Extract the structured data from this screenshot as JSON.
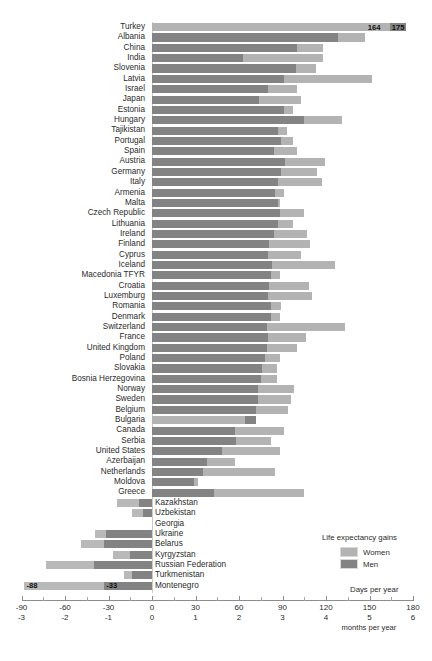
{
  "legend": {
    "title": "Life expectancy gains",
    "women_label": "Women",
    "men_label": "Men",
    "women_color": "#b3b3b3",
    "men_color": "#838383"
  },
  "axis": {
    "days_label": "Days per year",
    "months_label": "months per year",
    "days_ticks": [
      "-90",
      "-60",
      "-30",
      "0",
      "30",
      "60",
      "90",
      "120",
      "150",
      "180"
    ],
    "months_ticks": [
      "-3",
      "-2",
      "-1",
      "0",
      "1",
      "2",
      "3",
      "4",
      "5",
      "6"
    ]
  },
  "value_labels": {
    "turkey_women": "164",
    "turkey_men": "175",
    "montenegro_women": "-88",
    "montenegro_men": "-33"
  },
  "chart_data": {
    "type": "bar",
    "title": "",
    "xlabel": "Days per year",
    "ylabel": "",
    "xlim": [
      -90,
      180
    ],
    "grid": false,
    "legend_position": "bottom-right",
    "orientation": "horizontal",
    "secondary_xaxis": {
      "label": "months per year",
      "ticks": [
        -3,
        -2,
        -1,
        0,
        1,
        2,
        3,
        4,
        5,
        6
      ]
    },
    "categories": [
      "Turkey",
      "Albania",
      "China",
      "India",
      "Slovenia",
      "Latvia",
      "Israel",
      "Japan",
      "Estonia",
      "Hungary",
      "Tajikistan",
      "Portugal",
      "Spain",
      "Austria",
      "Germany",
      "Italy",
      "Armenia",
      "Malta",
      "Czech Republic",
      "Lithuania",
      "Ireland",
      "Finland",
      "Cyprus",
      "Iceland",
      "Macedonia TFYR",
      "Croatia",
      "Luxemburg",
      "Romania",
      "Denmark",
      "Switzerland",
      "France",
      "United Kingdom",
      "Poland",
      "Slovakia",
      "Bosnia Herzegovina",
      "Norway",
      "Sweden",
      "Belgium",
      "Bulgaria",
      "Canada",
      "Serbia",
      "United States",
      "Azerbaijan",
      "Netherlands",
      "Moldova",
      "Greece",
      "Kazakhstan",
      "Uzbekistan",
      "Georgia",
      "Ukraine",
      "Belarus",
      "Kyrgyzstan",
      "Russian Federation",
      "Turkmenistan",
      "Montenegro"
    ],
    "series": [
      {
        "name": "Women",
        "color": "#b3b3b3",
        "values": [
          164,
          147,
          118,
          118,
          113,
          152,
          100,
          103,
          97,
          131,
          93,
          97,
          100,
          119,
          114,
          117,
          91,
          88,
          105,
          97,
          107,
          109,
          103,
          126,
          88,
          108,
          110,
          89,
          88,
          133,
          106,
          100,
          88,
          86,
          86,
          98,
          96,
          94,
          64,
          91,
          82,
          88,
          57,
          85,
          32,
          105,
          -24,
          -14,
          0,
          -39,
          -49,
          -27,
          -73,
          -19,
          -88
        ]
      },
      {
        "name": "Men",
        "color": "#838383",
        "values": [
          175,
          128,
          100,
          63,
          99,
          91,
          80,
          74,
          91,
          105,
          87,
          89,
          84,
          92,
          89,
          87,
          85,
          87,
          88,
          87,
          84,
          81,
          80,
          83,
          82,
          81,
          80,
          82,
          82,
          79,
          80,
          79,
          78,
          76,
          75,
          73,
          73,
          72,
          72,
          57,
          58,
          48,
          38,
          35,
          29,
          43,
          -9,
          -6,
          0,
          -32,
          -33,
          -15,
          -40,
          -14,
          -33
        ]
      }
    ],
    "note": "Paired horizontal bars per country; bars are overlaid sharing a common baseline at 0."
  },
  "rows": [
    {
      "name": "Turkey",
      "w": 164,
      "m": 175,
      "side": "left"
    },
    {
      "name": "Albania",
      "w": 147,
      "m": 128,
      "side": "left"
    },
    {
      "name": "China",
      "w": 118,
      "m": 100,
      "side": "left"
    },
    {
      "name": "India",
      "w": 118,
      "m": 63,
      "side": "left"
    },
    {
      "name": "Slovenia",
      "w": 113,
      "m": 99,
      "side": "left"
    },
    {
      "name": "Latvia",
      "w": 152,
      "m": 91,
      "side": "left"
    },
    {
      "name": "Israel",
      "w": 100,
      "m": 80,
      "side": "left"
    },
    {
      "name": "Japan",
      "w": 103,
      "m": 74,
      "side": "left"
    },
    {
      "name": "Estonia",
      "w": 97,
      "m": 91,
      "side": "left"
    },
    {
      "name": "Hungary",
      "w": 131,
      "m": 105,
      "side": "left"
    },
    {
      "name": "Tajikistan",
      "w": 93,
      "m": 87,
      "side": "left"
    },
    {
      "name": "Portugal",
      "w": 97,
      "m": 89,
      "side": "left"
    },
    {
      "name": "Spain",
      "w": 100,
      "m": 84,
      "side": "left"
    },
    {
      "name": "Austria",
      "w": 119,
      "m": 92,
      "side": "left"
    },
    {
      "name": "Germany",
      "w": 114,
      "m": 89,
      "side": "left"
    },
    {
      "name": "Italy",
      "w": 117,
      "m": 87,
      "side": "left"
    },
    {
      "name": "Armenia",
      "w": 91,
      "m": 85,
      "side": "left"
    },
    {
      "name": "Malta",
      "w": 88,
      "m": 87,
      "side": "left"
    },
    {
      "name": "Czech Republic",
      "w": 105,
      "m": 88,
      "side": "left"
    },
    {
      "name": "Lithuania",
      "w": 97,
      "m": 87,
      "side": "left"
    },
    {
      "name": "Ireland",
      "w": 107,
      "m": 84,
      "side": "left"
    },
    {
      "name": "Finland",
      "w": 109,
      "m": 81,
      "side": "left"
    },
    {
      "name": "Cyprus",
      "w": 103,
      "m": 80,
      "side": "left"
    },
    {
      "name": "Iceland",
      "w": 126,
      "m": 83,
      "side": "left"
    },
    {
      "name": "Macedonia TFYR",
      "w": 88,
      "m": 82,
      "side": "left"
    },
    {
      "name": "Croatia",
      "w": 108,
      "m": 81,
      "side": "left"
    },
    {
      "name": "Luxemburg",
      "w": 110,
      "m": 80,
      "side": "left"
    },
    {
      "name": "Romania",
      "w": 89,
      "m": 82,
      "side": "left"
    },
    {
      "name": "Denmark",
      "w": 88,
      "m": 82,
      "side": "left"
    },
    {
      "name": "Switzerland",
      "w": 133,
      "m": 79,
      "side": "left"
    },
    {
      "name": "France",
      "w": 106,
      "m": 80,
      "side": "left"
    },
    {
      "name": "United Kingdom",
      "w": 100,
      "m": 79,
      "side": "left"
    },
    {
      "name": "Poland",
      "w": 88,
      "m": 78,
      "side": "left"
    },
    {
      "name": "Slovakia",
      "w": 86,
      "m": 76,
      "side": "left"
    },
    {
      "name": "Bosnia Herzegovina",
      "w": 86,
      "m": 75,
      "side": "left"
    },
    {
      "name": "Norway",
      "w": 98,
      "m": 73,
      "side": "left"
    },
    {
      "name": "Sweden",
      "w": 96,
      "m": 73,
      "side": "left"
    },
    {
      "name": "Belgium",
      "w": 94,
      "m": 72,
      "side": "left"
    },
    {
      "name": "Bulgaria",
      "w": 64,
      "m": 72,
      "side": "left"
    },
    {
      "name": "Canada",
      "w": 91,
      "m": 57,
      "side": "left"
    },
    {
      "name": "Serbia",
      "w": 82,
      "m": 58,
      "side": "left"
    },
    {
      "name": "United States",
      "w": 88,
      "m": 48,
      "side": "left"
    },
    {
      "name": "Azerbaijan",
      "w": 57,
      "m": 38,
      "side": "left"
    },
    {
      "name": "Netherlands",
      "w": 85,
      "m": 35,
      "side": "left"
    },
    {
      "name": "Moldova",
      "w": 32,
      "m": 29,
      "side": "left"
    },
    {
      "name": "Greece",
      "w": 105,
      "m": 43,
      "side": "left"
    },
    {
      "name": "Kazakhstan",
      "w": -24,
      "m": -9,
      "side": "right"
    },
    {
      "name": "Uzbekistan",
      "w": -14,
      "m": -6,
      "side": "right"
    },
    {
      "name": "Georgia",
      "w": 0,
      "m": 0,
      "side": "right"
    },
    {
      "name": "Ukraine",
      "w": -39,
      "m": -32,
      "side": "right"
    },
    {
      "name": "Belarus",
      "w": -49,
      "m": -33,
      "side": "right"
    },
    {
      "name": "Kyrgyzstan",
      "w": -27,
      "m": -15,
      "side": "right"
    },
    {
      "name": "Russian Federation",
      "w": -73,
      "m": -40,
      "side": "right"
    },
    {
      "name": "Turkmenistan",
      "w": -19,
      "m": -14,
      "side": "right"
    },
    {
      "name": "Montenegro",
      "w": -88,
      "m": -33,
      "side": "right"
    }
  ]
}
